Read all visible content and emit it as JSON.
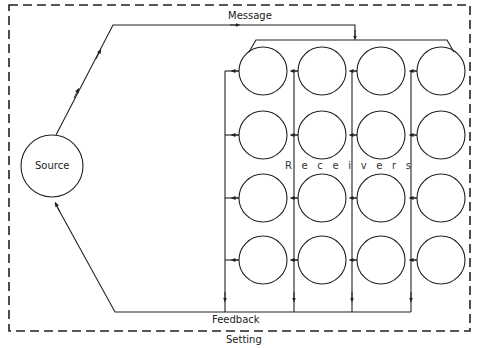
{
  "diagram": {
    "labels": {
      "message": "Message",
      "source": "Source",
      "receivers": "Receivers",
      "feedback": "Feedback",
      "setting": "Setting"
    },
    "receivers_letters": [
      "R",
      "e",
      "c",
      "e",
      "i",
      "v",
      "e",
      "r",
      "s"
    ],
    "source_node": {
      "cx": 52,
      "cy": 166,
      "r": 31
    },
    "receiver_grid": {
      "columns_cx": [
        263,
        322,
        381,
        441
      ],
      "rows_cy": [
        71,
        135,
        198,
        260
      ],
      "r": 24,
      "feedback_lines_x": [
        225,
        294,
        352,
        411
      ],
      "feedback_bottom_y": 312
    },
    "setting_border": {
      "x1": 9,
      "y1": 5,
      "x2": 470,
      "y2": 331
    },
    "colors": {
      "stroke": "#222222",
      "background": "#ffffff"
    }
  }
}
